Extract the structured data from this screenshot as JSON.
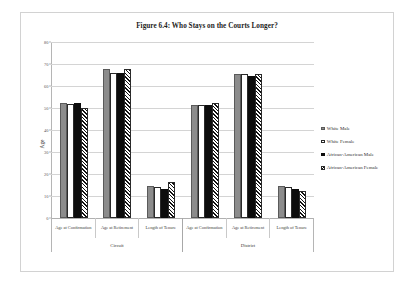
{
  "chart_data": {
    "type": "bar",
    "title": "Figure 6.4: Who Stays on the Courts Longer?",
    "xlabel": "",
    "ylabel": "Age",
    "ylim": [
      0,
      80
    ],
    "yticks": [
      0,
      10,
      20,
      30,
      40,
      50,
      60,
      70,
      80
    ],
    "ytick_labels": [
      "0",
      "10",
      "20",
      "30",
      "40",
      "50",
      "60",
      "70",
      "80"
    ],
    "grid": true,
    "legend_position": "right",
    "groups": [
      "Circuit",
      "District"
    ],
    "categories": [
      "Age at Confirmation",
      "Age at Retirement",
      "Length of Tenure",
      "Age at Confirmation",
      "Age at Retirement",
      "Length of Tenure"
    ],
    "series": [
      {
        "name": "White Male",
        "style": "solid-gray",
        "color": "#8c8c8c",
        "values": [
          52.3,
          67.8,
          14.6,
          51.2,
          65.5,
          14.7
        ]
      },
      {
        "name": "White Female",
        "style": "white-outline",
        "color": "#ffffff",
        "values": [
          51.8,
          65.8,
          14.0,
          51.5,
          65.5,
          14.0
        ]
      },
      {
        "name": "African-American Male",
        "style": "solid-black",
        "color": "#0d0d0d",
        "values": [
          52.1,
          65.8,
          13.4,
          51.3,
          64.4,
          13.0
        ]
      },
      {
        "name": "African-American Female",
        "style": "diagonal-hatch",
        "color": "#111111",
        "values": [
          50.2,
          67.7,
          16.5,
          52.4,
          65.3,
          12.4
        ]
      }
    ]
  },
  "legend": {
    "items": [
      {
        "label": "White Male"
      },
      {
        "label": "White Female"
      },
      {
        "label": "African-American Male"
      },
      {
        "label": "African-American Female"
      }
    ]
  }
}
